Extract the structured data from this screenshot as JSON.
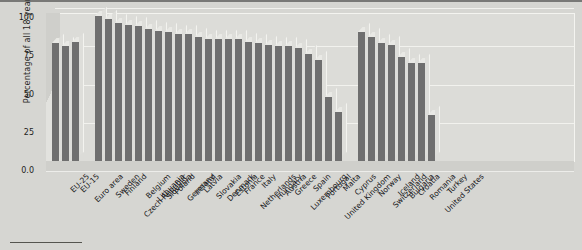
{
  "chart_data": {
    "type": "bar",
    "title": "",
    "subtitle": "",
    "xlabel": "",
    "ylabel": "Percentage of all 18-year-olds",
    "ylim": [
      0,
      100
    ],
    "ytick_labels": [
      "0.0",
      "25",
      "50",
      "75",
      "100"
    ],
    "ytick_values": [
      0,
      25,
      50,
      75,
      100
    ],
    "grid": true,
    "legend": null,
    "legend_position": "none",
    "style": "3d-bar",
    "bar_color": "#6f6f6f",
    "groups": [
      {
        "name": "aggregates",
        "categories": [
          "EU-25",
          "EU-15",
          "Euro area"
        ],
        "values": [
          77,
          75,
          78
        ]
      },
      {
        "name": "member-states",
        "categories": [
          "Sweden",
          "Finland",
          "Czech Republic",
          "Belgium",
          "Lithuania",
          "Slovenia",
          "Poland",
          "Germany",
          "Ireland",
          "Latvia",
          "Slovakia",
          "Denmark",
          "Estonia",
          "France",
          "Netherlands",
          "Italy",
          "Hungary",
          "Austria",
          "Greece",
          "Luxembourg",
          "Spain",
          "Portugal",
          "United Kingdom",
          "Malta",
          "Cyprus"
        ],
        "values": [
          95,
          93,
          90,
          89,
          88,
          86,
          85,
          84,
          83,
          83,
          81,
          80,
          80,
          80,
          80,
          78,
          77,
          76,
          75,
          75,
          74,
          70,
          66,
          42,
          32
        ]
      },
      {
        "name": "non-member-countries",
        "categories": [
          "Norway",
          "Switzerland",
          "Iceland",
          "Bulgaria",
          "Croatia",
          "Romania",
          "United States",
          "Turkey"
        ],
        "values": [
          84,
          81,
          77,
          76,
          68,
          64,
          64,
          30
        ]
      }
    ],
    "categories": [
      "EU-25",
      "EU-15",
      "Euro area",
      "Sweden",
      "Finland",
      "Czech Republic",
      "Belgium",
      "Lithuania",
      "Slovenia",
      "Poland",
      "Germany",
      "Ireland",
      "Latvia",
      "Slovakia",
      "Denmark",
      "Estonia",
      "France",
      "Netherlands",
      "Italy",
      "Hungary",
      "Austria",
      "Greece",
      "Luxembourg",
      "Spain",
      "Portugal",
      "United Kingdom",
      "Malta",
      "Cyprus",
      "Norway",
      "Switzerland",
      "Iceland",
      "Bulgaria",
      "Croatia",
      "Romania",
      "United States",
      "Turkey"
    ],
    "values": [
      77,
      75,
      78,
      95,
      93,
      90,
      89,
      88,
      86,
      85,
      84,
      83,
      83,
      81,
      80,
      80,
      80,
      80,
      78,
      77,
      76,
      75,
      75,
      74,
      70,
      66,
      42,
      32,
      84,
      81,
      77,
      76,
      68,
      64,
      64,
      30
    ]
  }
}
